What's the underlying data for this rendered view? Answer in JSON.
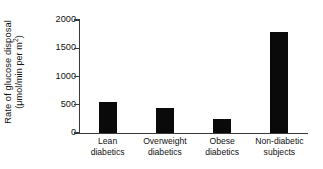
{
  "chart_data": {
    "type": "bar",
    "title": "",
    "subtitle": "",
    "xlabel": "",
    "ylabel": "Rate of glucose disposal (μmol/min per m²)",
    "ylabel_line1": "Rate of glucose disposal",
    "ylabel_line2_pre": "(μmol/min per m",
    "ylabel_line2_exp": "2",
    "ylabel_line2_post": ")",
    "categories": [
      "Lean diabetics",
      "Overweight diabetics",
      "Obese diabetics",
      "Non-diabetic subjects"
    ],
    "category_lines": [
      [
        "Lean",
        "diabetics"
      ],
      [
        "Overweight",
        "diabetics"
      ],
      [
        "Obese",
        "diabetics"
      ],
      [
        "Non-diabetic",
        "subjects"
      ]
    ],
    "values": [
      550,
      450,
      250,
      1780
    ],
    "ylim": [
      0,
      2000
    ],
    "yticks": [
      0,
      500,
      1000,
      1500,
      2000
    ],
    "ytick_labels": [
      "0",
      "500",
      "1000",
      "1500",
      "2000"
    ],
    "grid": false,
    "legend": null,
    "bar_color": "#0a0a0a",
    "axis_color": "#3a3a3a",
    "background": "#ffffff"
  }
}
